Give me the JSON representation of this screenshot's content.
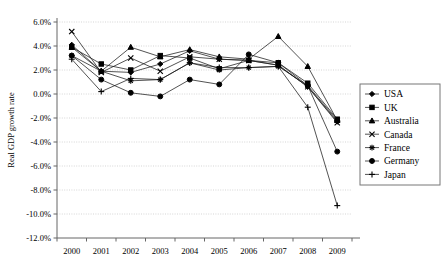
{
  "chart_data": {
    "type": "line",
    "title": "",
    "xlabel": "",
    "ylabel": "Real GDP growth rate",
    "categories": [
      "2000",
      "2001",
      "2002",
      "2003",
      "2004",
      "2005",
      "2006",
      "2007",
      "2008",
      "2009"
    ],
    "ylim": [
      -12.0,
      6.0
    ],
    "ytick_step": 2.0,
    "ytick_labels": [
      "6.0%",
      "4.0%",
      "2.0%",
      "0.0%",
      "-2.0%",
      "-4.0%",
      "-6.0%",
      "-8.0%",
      "-10.0%",
      "-12.0%"
    ],
    "ytick_values": [
      6.0,
      4.0,
      2.0,
      0.0,
      -2.0,
      -4.0,
      -6.0,
      -8.0,
      -10.0,
      -12.0
    ],
    "grid": true,
    "legend_position": "right",
    "units": "percent",
    "series": [
      {
        "name": "USA",
        "marker": "diamond",
        "values": [
          4.1,
          1.9,
          1.8,
          2.5,
          3.6,
          2.9,
          2.8,
          2.4,
          0.6,
          -2.3
        ]
      },
      {
        "name": "UK",
        "marker": "square",
        "values": [
          3.9,
          2.5,
          2.0,
          3.2,
          3.0,
          2.1,
          2.8,
          2.6,
          0.9,
          -2.1
        ]
      },
      {
        "name": "Australia",
        "marker": "triangle",
        "values": [
          3.9,
          1.9,
          3.9,
          3.1,
          3.7,
          3.1,
          2.9,
          4.8,
          2.3,
          -2.2
        ]
      },
      {
        "name": "Canada",
        "marker": "cross-x",
        "values": [
          5.2,
          1.8,
          3.0,
          1.9,
          3.1,
          2.9,
          2.8,
          2.4,
          0.6,
          -2.4
        ]
      },
      {
        "name": "France",
        "marker": "asterisk",
        "values": [
          3.2,
          1.9,
          1.1,
          1.2,
          2.6,
          2.0,
          2.2,
          2.3,
          0.7,
          -2.2
        ]
      },
      {
        "name": "Germany",
        "marker": "circle",
        "values": [
          3.2,
          1.2,
          0.1,
          -0.2,
          1.2,
          0.8,
          3.3,
          2.6,
          0.7,
          -4.8
        ]
      },
      {
        "name": "Japan",
        "marker": "plus",
        "values": [
          2.9,
          0.2,
          1.3,
          1.2,
          2.6,
          2.2,
          2.2,
          2.3,
          -1.1,
          -9.3
        ]
      }
    ]
  },
  "legend": {
    "entries": [
      {
        "label": "USA"
      },
      {
        "label": "UK"
      },
      {
        "label": "Australia"
      },
      {
        "label": "Canada"
      },
      {
        "label": "France"
      },
      {
        "label": "Germany"
      },
      {
        "label": "Japan"
      }
    ]
  }
}
